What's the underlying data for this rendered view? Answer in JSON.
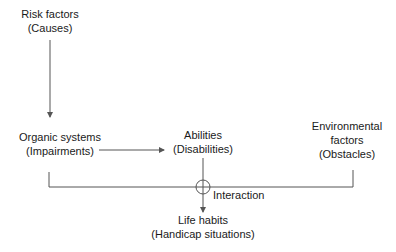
{
  "diagram": {
    "nodes": {
      "risk_factors": {
        "line1": "Risk factors",
        "line2": "(Causes)"
      },
      "organic_systems": {
        "line1": "Organic systems",
        "line2": "(Impairments)"
      },
      "abilities": {
        "line1": "Abilities",
        "line2": "(Disabilities)"
      },
      "environmental_factors": {
        "line1": "Environmental",
        "line2": "factors",
        "line3": "(Obstacles)"
      },
      "life_habits": {
        "line1": "Life habits",
        "line2": "(Handicap situations)"
      }
    },
    "interaction_label": "Interaction",
    "edges": [
      {
        "from": "risk_factors",
        "to": "organic_systems"
      },
      {
        "from": "organic_systems",
        "to": "abilities"
      },
      {
        "from": "interaction",
        "to": "life_habits"
      }
    ],
    "colors": {
      "line": "#555555",
      "text": "#1a1a1a"
    }
  }
}
